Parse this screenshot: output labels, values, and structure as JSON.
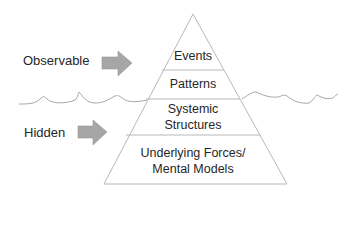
{
  "side_labels": {
    "observable": "Observable",
    "hidden": "Hidden"
  },
  "pyramid": {
    "layers": [
      {
        "label": "Events"
      },
      {
        "label": "Patterns"
      },
      {
        "label_line1": "Systemic",
        "label_line2": "Structures"
      },
      {
        "label_line1": "Underlying Forces/",
        "label_line2": "Mental Models"
      }
    ]
  },
  "colors": {
    "arrow_fill": "#a6a6a6",
    "line": "#b4b4b4",
    "text": "#262626",
    "background": "#ffffff"
  },
  "icons": {
    "observable_arrow": "right-arrow-icon",
    "hidden_arrow": "right-arrow-icon",
    "waterline": "wave-line"
  }
}
